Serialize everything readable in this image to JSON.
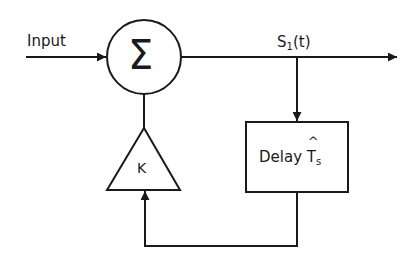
{
  "diagram": {
    "labels": {
      "input": "Input",
      "output_signal": "S",
      "output_signal_sub": "1",
      "output_signal_arg": "(t)",
      "summer_symbol": "Σ",
      "gain": "K",
      "delay_text": "Delay",
      "delay_symbol": "T",
      "delay_symbol_hat": "^",
      "delay_symbol_sub": "s"
    },
    "nodes": [
      {
        "id": "summer",
        "shape": "circle",
        "label": "Σ"
      },
      {
        "id": "gain",
        "shape": "triangle",
        "label": "K"
      },
      {
        "id": "delay",
        "shape": "rectangle",
        "label": "Delay T̂s"
      }
    ],
    "edges": [
      {
        "from": "input",
        "to": "summer",
        "label": "Input"
      },
      {
        "from": "summer",
        "to": "output",
        "label": "S1(t)"
      },
      {
        "from": "summer-output",
        "to": "delay"
      },
      {
        "from": "delay",
        "to": "gain"
      },
      {
        "from": "gain",
        "to": "summer"
      }
    ],
    "colors": {
      "stroke": "#1a1a1a",
      "background": "#ffffff"
    }
  }
}
